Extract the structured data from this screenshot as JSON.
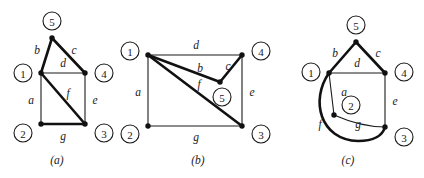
{
  "figure": {
    "background_color": "#ffffff",
    "ink_color": "#1a1a1a",
    "panels": [
      {
        "id": "panel-a",
        "caption": "(a)",
        "caption_x": 57,
        "caption_y": 160,
        "origin_x": 0,
        "width": 136,
        "nodes": [
          {
            "id": "n5",
            "label": "5",
            "dot_x": 52,
            "dot_y": 38,
            "circle_x": 52,
            "circle_y": 21,
            "r": 9
          },
          {
            "id": "n1",
            "label": "1",
            "dot_x": 41,
            "dot_y": 73,
            "circle_x": 23,
            "circle_y": 73,
            "r": 9
          },
          {
            "id": "n4",
            "label": "4",
            "dot_x": 85,
            "dot_y": 73,
            "circle_x": 104,
            "circle_y": 73,
            "r": 9
          },
          {
            "id": "n2",
            "label": "2",
            "dot_x": 41,
            "dot_y": 124,
            "circle_x": 23,
            "circle_y": 133,
            "r": 9
          },
          {
            "id": "n3",
            "label": "3",
            "dot_x": 85,
            "dot_y": 124,
            "circle_x": 104,
            "circle_y": 133,
            "r": 9
          }
        ],
        "edges": [
          {
            "id": "a",
            "label": "a",
            "from": "n1",
            "to": "n2",
            "weight": "thin",
            "path": "M 41 73 L 41 124",
            "label_x": 31,
            "label_y": 100
          },
          {
            "id": "b",
            "label": "b",
            "from": "n1",
            "to": "n5",
            "weight": "thick",
            "path": "M 41 73 L 52 38",
            "label_x": 37,
            "label_y": 50
          },
          {
            "id": "c",
            "label": "c",
            "from": "n5",
            "to": "n4",
            "weight": "thick",
            "path": "M 52 38 L 85 73",
            "label_x": 74,
            "label_y": 50
          },
          {
            "id": "d",
            "label": "d",
            "from": "n1",
            "to": "n4",
            "weight": "thin",
            "path": "M 41 73 L 85 73",
            "label_x": 63,
            "label_y": 63
          },
          {
            "id": "e",
            "label": "e",
            "from": "n4",
            "to": "n3",
            "weight": "thin",
            "path": "M 85 73 L 85 124",
            "label_x": 95,
            "label_y": 100
          },
          {
            "id": "f",
            "label": "f",
            "from": "n1",
            "to": "n3",
            "weight": "thick",
            "path": "M 41 73 L 85 124",
            "label_x": 68,
            "label_y": 93
          },
          {
            "id": "g",
            "label": "g",
            "from": "n2",
            "to": "n3",
            "weight": "thick",
            "path": "M 41 124 L 85 124",
            "label_x": 63,
            "label_y": 136
          }
        ]
      },
      {
        "id": "panel-b",
        "caption": "(b)",
        "caption_x": 198,
        "caption_y": 160,
        "origin_x": 136,
        "width": 140,
        "nodes": [
          {
            "id": "n1",
            "label": "1",
            "dot_x": 148,
            "dot_y": 55,
            "circle_x": 130,
            "circle_y": 51,
            "r": 9
          },
          {
            "id": "n4",
            "label": "4",
            "dot_x": 242,
            "dot_y": 55,
            "circle_x": 261,
            "circle_y": 51,
            "r": 9
          },
          {
            "id": "n5",
            "label": "5",
            "dot_x": 220,
            "dot_y": 82,
            "circle_x": 222,
            "circle_y": 97,
            "r": 9
          },
          {
            "id": "n2",
            "label": "2",
            "dot_x": 148,
            "dot_y": 126,
            "circle_x": 130,
            "circle_y": 134,
            "r": 9
          },
          {
            "id": "n3",
            "label": "3",
            "dot_x": 242,
            "dot_y": 126,
            "circle_x": 261,
            "circle_y": 134,
            "r": 9
          }
        ],
        "edges": [
          {
            "id": "a",
            "label": "a",
            "from": "n1",
            "to": "n2",
            "weight": "thin",
            "path": "M 148 55 L 148 126",
            "label_x": 138,
            "label_y": 92
          },
          {
            "id": "d",
            "label": "d",
            "from": "n1",
            "to": "n4",
            "weight": "thin",
            "path": "M 148 55 L 242 55",
            "label_x": 196,
            "label_y": 45
          },
          {
            "id": "b",
            "label": "b",
            "from": "n1",
            "to": "n5",
            "weight": "thick",
            "path": "M 148 55 L 220 82",
            "label_x": 200,
            "label_y": 68
          },
          {
            "id": "c",
            "label": "c",
            "from": "n5",
            "to": "n4",
            "weight": "thick",
            "path": "M 220 82 L 242 55",
            "label_x": 228,
            "label_y": 66
          },
          {
            "id": "e",
            "label": "e",
            "from": "n4",
            "to": "n3",
            "weight": "thin",
            "path": "M 242 55 L 242 126",
            "label_x": 252,
            "label_y": 92
          },
          {
            "id": "f",
            "label": "f",
            "from": "n1",
            "to": "n3",
            "weight": "thick",
            "path": "M 148 55 L 242 126",
            "label_x": 199,
            "label_y": 84
          },
          {
            "id": "g",
            "label": "g",
            "from": "n2",
            "to": "n3",
            "weight": "thin",
            "path": "M 148 126 L 242 126",
            "label_x": 196,
            "label_y": 137
          }
        ]
      },
      {
        "id": "panel-c",
        "caption": "(c)",
        "caption_x": 348,
        "caption_y": 160,
        "origin_x": 276,
        "width": 148,
        "nodes": [
          {
            "id": "n5",
            "label": "5",
            "dot_x": 356,
            "dot_y": 42,
            "circle_x": 356,
            "circle_y": 25,
            "r": 9
          },
          {
            "id": "n1",
            "label": "1",
            "dot_x": 329,
            "dot_y": 73,
            "circle_x": 311,
            "circle_y": 72,
            "r": 9
          },
          {
            "id": "n4",
            "label": "4",
            "dot_x": 385,
            "dot_y": 73,
            "circle_x": 404,
            "circle_y": 72,
            "r": 9
          },
          {
            "id": "n2",
            "label": "2",
            "dot_x": 334,
            "dot_y": 115,
            "circle_x": 351,
            "circle_y": 105,
            "r": 9
          },
          {
            "id": "n3",
            "label": "3",
            "dot_x": 385,
            "dot_y": 127,
            "circle_x": 404,
            "circle_y": 137,
            "r": 9
          }
        ],
        "edges": [
          {
            "id": "b",
            "label": "b",
            "from": "n1",
            "to": "n5",
            "weight": "thick",
            "path": "M 329 73 L 356 42",
            "label_x": 335,
            "label_y": 53
          },
          {
            "id": "c",
            "label": "c",
            "from": "n5",
            "to": "n4",
            "weight": "thick",
            "path": "M 356 42 L 385 73",
            "label_x": 378,
            "label_y": 53
          },
          {
            "id": "d",
            "label": "d",
            "from": "n1",
            "to": "n4",
            "weight": "thin",
            "path": "M 329 73 L 385 73",
            "label_x": 357,
            "label_y": 63
          },
          {
            "id": "e",
            "label": "e",
            "from": "n4",
            "to": "n3",
            "weight": "thin",
            "path": "M 385 73 L 385 127",
            "label_x": 395,
            "label_y": 101
          },
          {
            "id": "a",
            "label": "a",
            "from": "n1",
            "to": "n2",
            "weight": "thin",
            "path": "M 329 73 L 334 115",
            "label_x": 344,
            "label_y": 92
          },
          {
            "id": "f",
            "label": "f",
            "from": "n1",
            "to": "n3",
            "weight": "thick",
            "path": "M 329 73 C 310 100, 320 140, 358 141 C 376 141, 383 134, 385 127",
            "label_x": 320,
            "label_y": 124
          },
          {
            "id": "g",
            "label": "g",
            "from": "n2",
            "to": "n3",
            "weight": "thin",
            "path": "M 334 115 C 350 122, 370 127, 385 127",
            "label_x": 358,
            "label_y": 124
          }
        ]
      }
    ]
  }
}
